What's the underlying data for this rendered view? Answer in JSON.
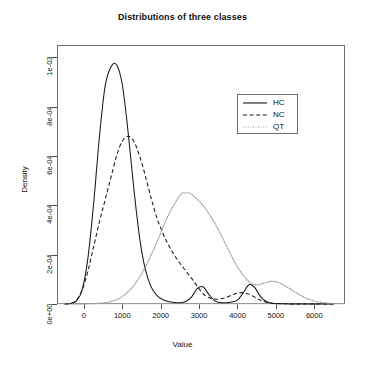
{
  "chart_data": {
    "type": "line",
    "title": "Distributions of three classes",
    "xlabel": "Value",
    "ylabel": "Density",
    "xlim": [
      -700,
      6800
    ],
    "ylim": [
      0,
      0.00105
    ],
    "xticks": [
      0,
      1000,
      2000,
      3000,
      4000,
      5000,
      6000
    ],
    "xtick_labels": [
      "0",
      "1000",
      "2000",
      "3000",
      "4000",
      "5000",
      "6000"
    ],
    "yticks": [
      0,
      0.0002,
      0.0004,
      0.0006,
      0.0008,
      0.001
    ],
    "ytick_labels": [
      "0e+00",
      "2e-04",
      "4e-04",
      "6e-04",
      "8e-04",
      "1e-03"
    ],
    "grid": false,
    "legend_position": "top-right",
    "series": [
      {
        "name": "HC",
        "linestyle": "solid",
        "color": "#1a1a1a",
        "peak_x": 850,
        "peak_y": 0.00097,
        "secondary_peaks": [
          {
            "x": 3000,
            "y": 7e-05
          },
          {
            "x": 4300,
            "y": 8e-05
          }
        ],
        "x": [
          -500,
          -350,
          -200,
          -50,
          100,
          250,
          400,
          550,
          700,
          850,
          1000,
          1150,
          1300,
          1450,
          1600,
          1750,
          1900,
          2050,
          2200,
          2350,
          2500,
          2650,
          2800,
          2950,
          3100,
          3250,
          3400,
          3550,
          3700,
          3850,
          4000,
          4150,
          4300,
          4450,
          4600,
          4750,
          4900,
          5200,
          5600,
          6000,
          6500
        ],
        "y": [
          0.0,
          2e-06,
          1.2e-05,
          5.5e-05,
          0.00018,
          0.0004,
          0.00067,
          0.00088,
          0.00096,
          0.00097,
          0.00089,
          0.0007,
          0.00047,
          0.00027,
          0.00014,
          7e-05,
          3.5e-05,
          1.8e-05,
          1e-05,
          6e-06,
          5e-06,
          1e-05,
          2.8e-05,
          6.2e-05,
          7e-05,
          4e-05,
          1.4e-05,
          6e-06,
          5e-06,
          8e-06,
          1.6e-05,
          4.5e-05,
          7.8e-05,
          6.6e-05,
          3e-05,
          1e-05,
          3e-06,
          1e-06,
          0.0,
          0.0,
          0.0
        ]
      },
      {
        "name": "NC",
        "linestyle": "dashed",
        "color": "#1a1a1a",
        "peak_x": 1150,
        "peak_y": 0.00068,
        "x": [
          -500,
          -350,
          -200,
          -50,
          100,
          250,
          400,
          550,
          700,
          850,
          1000,
          1150,
          1300,
          1450,
          1600,
          1750,
          1900,
          2050,
          2200,
          2350,
          2500,
          2650,
          2800,
          2950,
          3100,
          3250,
          3400,
          3550,
          3700,
          3850,
          4000,
          4150,
          4300,
          4450,
          4600,
          4750,
          4900,
          5200,
          5600,
          6000,
          6500
        ],
        "y": [
          0.0,
          3e-06,
          1.5e-05,
          5.5e-05,
          0.00013,
          0.00023,
          0.00033,
          0.00042,
          0.00051,
          0.0006,
          0.00066,
          0.00068,
          0.00066,
          0.0006,
          0.00052,
          0.00043,
          0.00035,
          0.00029,
          0.00024,
          0.0002,
          0.000165,
          0.000135,
          0.000105,
          7.2e-05,
          4.2e-05,
          2.6e-05,
          2e-05,
          2e-05,
          2.6e-05,
          3.6e-05,
          4.4e-05,
          4.6e-05,
          4e-05,
          2.8e-05,
          1.5e-05,
          7e-06,
          3e-06,
          1e-06,
          0.0,
          0.0,
          0.0
        ]
      },
      {
        "name": "QT",
        "linestyle": "dotted",
        "color": "#9a9a9a",
        "peak_x": 2650,
        "peak_y": 0.00045,
        "secondary_peaks": [
          {
            "x": 4900,
            "y": 9e-05
          }
        ],
        "x": [
          -500,
          -200,
          100,
          400,
          700,
          1000,
          1300,
          1600,
          1900,
          2200,
          2500,
          2650,
          2800,
          3100,
          3400,
          3700,
          4000,
          4300,
          4500,
          4700,
          4900,
          5100,
          5400,
          5700,
          6000,
          6300,
          6600
        ],
        "y": [
          0.0,
          0.0,
          1e-06,
          3e-06,
          1e-05,
          3e-05,
          7.5e-05,
          0.00015,
          0.00025,
          0.00036,
          0.00044,
          0.00045,
          0.000445,
          0.0004,
          0.00033,
          0.00024,
          0.00015,
          9e-05,
          7.8e-05,
          8.5e-05,
          9.2e-05,
          8.5e-05,
          5.8e-05,
          3e-05,
          1.2e-05,
          4e-06,
          1e-06
        ]
      }
    ]
  },
  "legend": {
    "entries": [
      {
        "label": "HC",
        "style": "solid"
      },
      {
        "label": "NC",
        "style": "dashed"
      },
      {
        "label": "QT",
        "style": "dotted"
      }
    ]
  }
}
